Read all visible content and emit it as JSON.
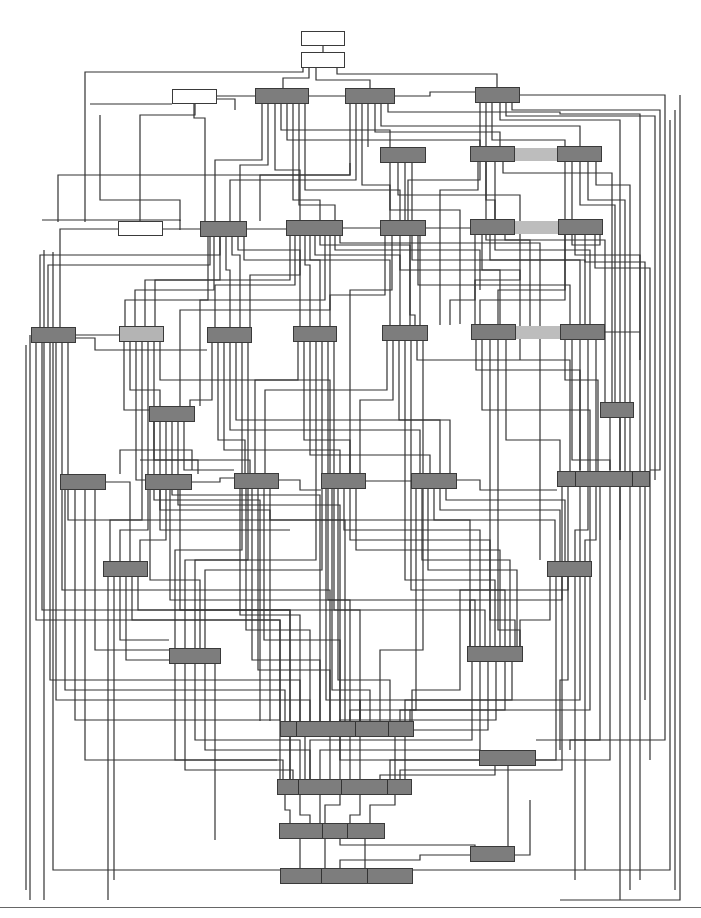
{
  "diagram": {
    "type": "block-diagram-unlabeled",
    "colors": {
      "node_dark": "#7d7d7d",
      "node_light": "#b4b4b4",
      "node_white": "#ffffff",
      "edge": "#333333",
      "bridge": "#bdbdbd",
      "background": "#ffffff"
    },
    "nodes": [
      {
        "id": "n1",
        "x": 301,
        "y": 31,
        "w": 44,
        "h": 15,
        "style": "white"
      },
      {
        "id": "n2",
        "x": 301,
        "y": 52,
        "w": 44,
        "h": 16,
        "style": "white"
      },
      {
        "id": "n3",
        "x": 172,
        "y": 89,
        "w": 45,
        "h": 15,
        "style": "white"
      },
      {
        "id": "n4",
        "x": 255,
        "y": 88,
        "w": 54,
        "h": 16,
        "style": "dark"
      },
      {
        "id": "n5",
        "x": 345,
        "y": 88,
        "w": 50,
        "h": 16,
        "style": "dark"
      },
      {
        "id": "n6",
        "x": 475,
        "y": 87,
        "w": 45,
        "h": 16,
        "style": "dark"
      },
      {
        "id": "n7",
        "x": 380,
        "y": 147,
        "w": 46,
        "h": 16,
        "style": "dark"
      },
      {
        "id": "n8",
        "x": 470,
        "y": 146,
        "w": 45,
        "h": 16,
        "style": "dark"
      },
      {
        "id": "n9",
        "x": 557,
        "y": 146,
        "w": 45,
        "h": 16,
        "style": "dark"
      },
      {
        "id": "n10",
        "x": 118,
        "y": 221,
        "w": 45,
        "h": 15,
        "style": "white"
      },
      {
        "id": "n11",
        "x": 200,
        "y": 221,
        "w": 47,
        "h": 16,
        "style": "dark"
      },
      {
        "id": "n12",
        "x": 286,
        "y": 220,
        "w": 57,
        "h": 16,
        "style": "dark"
      },
      {
        "id": "n13",
        "x": 380,
        "y": 220,
        "w": 46,
        "h": 16,
        "style": "dark"
      },
      {
        "id": "n14",
        "x": 470,
        "y": 219,
        "w": 45,
        "h": 16,
        "style": "dark"
      },
      {
        "id": "n15",
        "x": 558,
        "y": 219,
        "w": 45,
        "h": 16,
        "style": "dark"
      },
      {
        "id": "n16",
        "x": 31,
        "y": 327,
        "w": 45,
        "h": 16,
        "style": "dark"
      },
      {
        "id": "n17",
        "x": 119,
        "y": 326,
        "w": 45,
        "h": 16,
        "style": "light"
      },
      {
        "id": "n18",
        "x": 207,
        "y": 327,
        "w": 45,
        "h": 16,
        "style": "dark"
      },
      {
        "id": "n19",
        "x": 293,
        "y": 326,
        "w": 44,
        "h": 16,
        "style": "dark"
      },
      {
        "id": "n20",
        "x": 382,
        "y": 325,
        "w": 46,
        "h": 16,
        "style": "dark"
      },
      {
        "id": "n21",
        "x": 471,
        "y": 324,
        "w": 45,
        "h": 16,
        "style": "dark"
      },
      {
        "id": "n22",
        "x": 560,
        "y": 324,
        "w": 45,
        "h": 16,
        "style": "dark"
      },
      {
        "id": "n23",
        "x": 149,
        "y": 406,
        "w": 46,
        "h": 16,
        "style": "dark"
      },
      {
        "id": "n24",
        "x": 600,
        "y": 402,
        "w": 34,
        "h": 16,
        "style": "dark"
      },
      {
        "id": "n25",
        "x": 60,
        "y": 474,
        "w": 46,
        "h": 16,
        "style": "dark"
      },
      {
        "id": "n26",
        "x": 145,
        "y": 474,
        "w": 47,
        "h": 16,
        "style": "dark"
      },
      {
        "id": "n27",
        "x": 234,
        "y": 473,
        "w": 45,
        "h": 16,
        "style": "dark"
      },
      {
        "id": "n28",
        "x": 321,
        "y": 473,
        "w": 45,
        "h": 16,
        "style": "dark"
      },
      {
        "id": "n29",
        "x": 411,
        "y": 473,
        "w": 46,
        "h": 16,
        "style": "dark"
      },
      {
        "id": "n30",
        "x": 557,
        "y": 471,
        "w": 93,
        "h": 16,
        "style": "dark",
        "segments": [
          575,
          632
        ]
      },
      {
        "id": "n31",
        "x": 103,
        "y": 561,
        "w": 45,
        "h": 16,
        "style": "dark"
      },
      {
        "id": "n32",
        "x": 547,
        "y": 561,
        "w": 45,
        "h": 16,
        "style": "dark"
      },
      {
        "id": "n33",
        "x": 169,
        "y": 648,
        "w": 52,
        "h": 16,
        "style": "dark"
      },
      {
        "id": "n34",
        "x": 467,
        "y": 646,
        "w": 56,
        "h": 16,
        "style": "dark"
      },
      {
        "id": "n35",
        "x": 280,
        "y": 721,
        "w": 134,
        "h": 16,
        "style": "dark",
        "segments": [
          296,
          355,
          388
        ]
      },
      {
        "id": "n36",
        "x": 479,
        "y": 750,
        "w": 57,
        "h": 16,
        "style": "dark"
      },
      {
        "id": "n37",
        "x": 277,
        "y": 779,
        "w": 135,
        "h": 16,
        "style": "dark",
        "segments": [
          298,
          341,
          387
        ]
      },
      {
        "id": "n38",
        "x": 279,
        "y": 823,
        "w": 106,
        "h": 16,
        "style": "dark",
        "segments": [
          322,
          347
        ]
      },
      {
        "id": "n39",
        "x": 470,
        "y": 846,
        "w": 45,
        "h": 16,
        "style": "dark"
      },
      {
        "id": "n40",
        "x": 280,
        "y": 868,
        "w": 133,
        "h": 16,
        "style": "dark",
        "segments": [
          321,
          367
        ]
      }
    ],
    "bridges": [
      {
        "x": 515,
        "y": 148,
        "w": 42,
        "h": 13
      },
      {
        "x": 515,
        "y": 221,
        "w": 43,
        "h": 13
      },
      {
        "x": 516,
        "y": 326,
        "w": 44,
        "h": 13
      }
    ],
    "edges": [
      "M323 46 V52",
      "M309 68 V78 H283 V88",
      "M316 68 V80 H370 V88",
      "M337 68 V74 H497 V87",
      "M303 68 V72 H85 V222",
      "M217 96 H255",
      "M217 99 H235 V110",
      "M195 104 V115 H140 V229 H118",
      "M194 104 V118 H205 V221",
      "M262 104 V160 H215 V221",
      "M268 104 V165 H240 V221",
      "M275 104 V170 H300 V220",
      "M281 104 V130 H390 V147",
      "M287 104 V140 H480 V146",
      "M293 104 V200 H320 V220",
      "M299 104 V205 H335 V220",
      "M305 104 V190 H400 V220",
      "M309 96 H345",
      "M350 104 V175 H260 V221",
      "M356 104 V180 H230 V221",
      "M362 104 V185 H390 V220",
      "M368 104 V147",
      "M375 104 V132 H500 V146",
      "M381 104 V126 H580 V146",
      "M388 104 V112 H560 V114 H640 V360",
      "M395 96 H430 V92 H475",
      "M480 103 V180 H408 V220",
      "M486 103 V200 H495 V219",
      "M492 103 V140 H565 V146",
      "M500 103 V120 H620 V470",
      "M506 103 V116 H655 V480",
      "M512 103 V110 H660 V470 H650",
      "M520 95 H665 V740 H536",
      "M390 163 V210 H460 V324",
      "M398 163 V195 H520 V280 H475 V324",
      "M405 163 V230 H420 V325",
      "M412 163 V260 H580 V324",
      "M478 162 V190 H440 V325",
      "M486 162 V240 H530 V330",
      "M495 162 V250 H590 V324",
      "M503 162 V173 H612 V402",
      "M565 162 V300 H480 V324",
      "M572 162 V245 H600 V219",
      "M580 162 V205 H615 V402",
      "M588 162 V200 H625 V471",
      "M596 162 V185 H630 V471",
      "M48 329 V265 H210 V236",
      "M40 327 V255 H220 V237",
      "M36 343 V620 H280 V721",
      "M42 343 V610 H290 V721",
      "M50 343 V680 H300 V721",
      "M56 343 V700 H310 V721",
      "M62 343 V590 H330 V721",
      "M68 343 V520 H345 V721",
      "M76 335 H119",
      "M76 338 H95 V350 H207",
      "M208 237 V300 H125 V326",
      "M214 237 V290 H135 V326",
      "M220 237 V280 H145 V326",
      "M226 237 V270 H230 V327",
      "M232 237 V255 H240 V327",
      "M238 237 V250 H300 V326",
      "M244 237 V260 H390 V325",
      "M290 236 V280 H155 V326",
      "M295 236 V285 H215 V327",
      "M300 236 V275 H250 V327",
      "M305 236 V265 H310 V326",
      "M310 236 V260 H320 V326",
      "M315 236 V255 H400 V325",
      "M320 236 V245 H410 V325",
      "M325 236 V300 H200 V406",
      "M330 236 V310 H180 V406",
      "M335 236 V250 H480 V290",
      "M340 236 V243 H540 V560",
      "M385 236 V295 H330 V326",
      "M392 236 V290 H350 V480",
      "M400 236 V270 H500 V324",
      "M410 236 V315 H415 V325",
      "M418 236 V285 H570 V324",
      "M475 235 V300 H450 V325",
      "M482 235 V270 H520 V360",
      "M490 235 V260 H585 V324",
      "M505 235 V240 H605 V402",
      "M565 235 V290 H498 V324",
      "M575 235 V255 H640 V471",
      "M585 235 V262 H645 V700",
      "M595 235 V268 H650 V760",
      "M124 342 V410 H149",
      "M130 342 V390 H160 V406",
      "M136 342 V480 H145",
      "M142 342 V520 H110 V561",
      "M148 342 V530 H120 V561",
      "M154 342 V460 H250 V473",
      "M160 342 V380 H330 V473",
      "M212 343 V400 H190 V406",
      "M218 343 V440 H245 V473",
      "M224 343 V450 H340 V473",
      "M230 343 V430 H420 V473",
      "M236 343 V420 H440 V473",
      "M242 343 V550 H175 V648",
      "M248 343 V560 H185 V648",
      "M298 342 V380 H255 V473",
      "M304 342 V440 H350 V473",
      "M310 342 V455 H430 V473",
      "M316 342 V560 H195 V648",
      "M322 342 V570 H205 V648",
      "M328 342 V600 H475 V646",
      "M334 342 V610 H485 V646",
      "M387 341 V390 H265 V473",
      "M393 341 V400 H360 V473",
      "M399 341 V420 H450 V473",
      "M405 341 V580 H495 V646",
      "M411 341 V590 H505 V646",
      "M417 341 V360 H570 V471",
      "M423 341 V650 H380 V721",
      "M476 340 V370 H580 V471",
      "M482 340 V410 H590 V471",
      "M490 340 V620 H515 V646",
      "M498 340 V630 H520 V646",
      "M506 340 V440 H560 V471",
      "M565 340 V380 H598 V471",
      "M572 340 V460 H610 V471",
      "M580 340 V470",
      "M588 340 V530 H575 V561",
      "M596 340 V540 H585 V561",
      "M605 332 H640",
      "M610 418 V470",
      "M620 418 V540",
      "M154 422 V500 H260 V721",
      "M160 422 V510 H270 V721",
      "M166 422 V540 H140 V561",
      "M172 422 V495 H320 V721",
      "M178 422 V505 H340 V721",
      "M184 422 V470 H234",
      "M65 490 V690 H285 V721",
      "M75 490 V720 H280",
      "M85 490 V760 H277",
      "M95 490 V650 H169",
      "M106 482 H130 V561",
      "M150 490 V580 H200 V648",
      "M160 490 V530 H290",
      "M170 490 V600 H350 V721",
      "M180 490 V610 H360 V721",
      "M192 482 H220 V478 H234",
      "M240 489 V615 H300 V721",
      "M246 489 V630 H310 V721",
      "M252 489 V660 H320 V721",
      "M258 489 V670 H330 V721",
      "M264 489 V640 H340 V721",
      "M270 489 V520 H470 V646",
      "M279 480 H300 V490 H321",
      "M326 489 V700 H360 V721",
      "M332 489 V690 H370 V721",
      "M338 489 V680 H390 V721",
      "M344 489 V530 H480 V646",
      "M350 489 V540 H490 V646",
      "M356 489 V550 H500 V646",
      "M366 481 H411",
      "M416 489 V710 H400 V721",
      "M422 489 V560 H510 V646",
      "M428 489 V570 H517 V646",
      "M434 489 V520 H555 V561",
      "M440 489 V510 H560 V561",
      "M446 489 V500 H565 V561",
      "M457 480 H480 V490 H557",
      "M562 487 V600 H470 V646",
      "M568 487 V590 H460 V690 H412 V721",
      "M580 487 V700 H405 V721",
      "M590 487 V710 H410 V721",
      "M600 487 V740 H570 V750",
      "M610 487 V760 H536",
      "M620 487 V900",
      "M630 487 V890",
      "M640 487 V880",
      "M108 577 V900",
      "M114 577 V880",
      "M120 577 V640 H169",
      "M126 577 V660 H169",
      "M132 577 V620 H280 V779",
      "M138 577 V610 H290 V779",
      "M550 577 V620 H520 V646",
      "M556 577 V760 H390 V779",
      "M562 577 V770 H400 V779",
      "M568 577 V680 H560 V750",
      "M575 577 V880",
      "M585 577 V870",
      "M175 664 V760 H283 V779",
      "M185 664 V770 H293 V779",
      "M195 664 V740 H300 V779",
      "M205 664 V750 H310 V779",
      "M215 664 V840",
      "M472 662 V740 H310 V779",
      "M480 662 V750 H320 V779",
      "M488 662 V730 H330 V779",
      "M496 662 V720 H340 V779",
      "M505 662 V710 H350 V779",
      "M512 662 V700 H360 V779",
      "M290 737 V779",
      "M305 737 V779",
      "M340 737 V760 H480",
      "M395 737 V779",
      "M405 737 V779",
      "M508 766 V846",
      "M495 766 V775 H380 V779",
      "M285 795 V810 H290 V823",
      "M300 795 V815 H310 V823",
      "M320 795 V823",
      "M340 795 V805 H325 V823",
      "M360 795 V815 H350 V823",
      "M395 795 V805 H370 V823",
      "M300 839 V868",
      "M325 839 V868",
      "M340 839 V845 H475 V846",
      "M365 839 V868",
      "M470 855 H420 V860 H340 V868",
      "M515 855 H530 V800",
      "M58 222 V175 H350 V163",
      "M90 104 H172",
      "M100 115 V200 H180 V221",
      "M118 229 H60 V327",
      "M163 229 H200",
      "M247 229 H286",
      "M343 228 H380",
      "M426 228 H470",
      "M30 335 V900",
      "M26 345 V890",
      "M192 470 V450 H120 V474",
      "M260 478 H234",
      "M198 474 V460 H140",
      "M680 95 V900 H560",
      "M675 110 V890",
      "M670 120 V870 H413",
      "M42 220 H180 V230",
      "M44 250 V900",
      "M53 252 V870 H280"
    ]
  }
}
